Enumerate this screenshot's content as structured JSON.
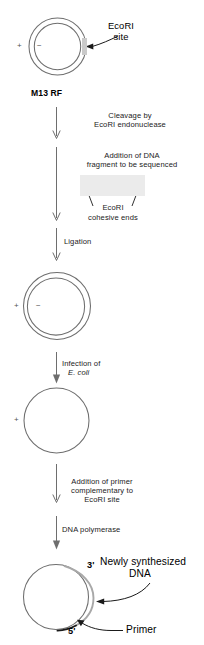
{
  "figure": {
    "width": 204,
    "height": 645,
    "colors": {
      "background": "#ffffff",
      "stroke": "#6e6e6e",
      "text": "#1a1a1a",
      "fragment_box": "#ebebeb",
      "site_mark": "#c9c9c9",
      "new_dna": "#a8a8a8",
      "primer": "#1a1a1a"
    }
  },
  "stages": {
    "m13_rf": {
      "label": "M13 RF",
      "plus_sign": "+",
      "minus_sign": "−",
      "callout": "EcoRI\nsite",
      "callout_line1": "EcoRI",
      "callout_line2": "site"
    },
    "ligated": {
      "plus_sign": "+",
      "minus_sign": "−"
    },
    "single_strand": {
      "plus_sign": "+"
    },
    "primed": {
      "three_prime": "3'",
      "five_prime": "5'",
      "new_dna_label_line1": "Newly synthesized",
      "new_dna_label_line2": "DNA",
      "primer_label": "Primer"
    }
  },
  "steps": [
    {
      "id": "cleavage",
      "line1": "Cleavage by",
      "line2": "EcoRI endonuclease"
    },
    {
      "id": "addition-of-dna",
      "line1": "Addition of DNA",
      "line2": "fragment to be sequenced"
    },
    {
      "id": "ligation",
      "line1": "Ligation"
    },
    {
      "id": "infection",
      "line1": "Infection of",
      "line2": "E. coli"
    },
    {
      "id": "primer-addition",
      "line1": "Addition of primer",
      "line2": "complementary to",
      "line3": "EcoRI site"
    },
    {
      "id": "polymerase",
      "line1": "DNA polymerase"
    }
  ],
  "fragment": {
    "cohesive_label_line1": "EcoRI",
    "cohesive_label_line2": "cohesive ends"
  }
}
